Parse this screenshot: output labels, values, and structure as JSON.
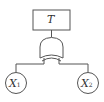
{
  "diagram": {
    "type": "fault-tree",
    "top_event": {
      "label": "T"
    },
    "gate": {
      "type": "OR"
    },
    "basic_events": [
      {
        "label": "X",
        "subscript": "1"
      },
      {
        "label": "X",
        "subscript": "2"
      }
    ],
    "colors": {
      "stroke": "#555555",
      "background": "#ffffff"
    }
  }
}
